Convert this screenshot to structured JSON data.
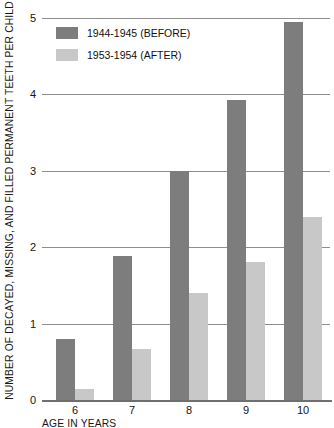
{
  "chart_data": {
    "type": "bar",
    "title": "",
    "xlabel": "AGE IN YEARS",
    "ylabel": "NUMBER OF DECAYED, MISSING, AND FILLED PERMANENT TEETH PER CHILD",
    "categories": [
      "6",
      "7",
      "8",
      "9",
      "10"
    ],
    "series": [
      {
        "name": "1944-1945 (BEFORE)",
        "color": "#7d7d7d",
        "values": [
          0.8,
          1.88,
          3.0,
          3.93,
          4.95
        ]
      },
      {
        "name": "1953-1954 (AFTER)",
        "color": "#c8c8c8",
        "values": [
          0.15,
          0.67,
          1.4,
          1.8,
          2.4
        ]
      }
    ],
    "ylim": [
      0,
      5
    ],
    "yticks": [
      "0",
      "1",
      "2",
      "3",
      "4",
      "5"
    ],
    "grid": true,
    "legend_position": "top-left"
  },
  "legend": {
    "items": [
      {
        "label": "1944-1945 (BEFORE)"
      },
      {
        "label": "1953-1954 (AFTER)"
      }
    ]
  },
  "axes": {
    "y_title": "NUMBER OF DECAYED, MISSING, AND FILLED PERMANENT TEETH PER CHILD",
    "x_title": "AGE IN YEARS"
  }
}
